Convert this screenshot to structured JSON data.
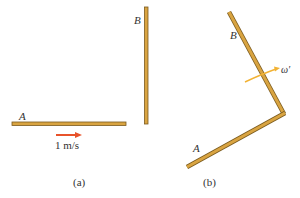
{
  "figure_a": {
    "rod_a_label": "A",
    "rod_b_label": "B",
    "velocity_label": "1 m/s",
    "caption": "(a)"
  },
  "figure_b": {
    "rod_a_label": "A",
    "rod_b_label": "B",
    "angular_velocity_label": "ω′",
    "caption": "(b)"
  },
  "colors": {
    "rod_fill": "#D9A441",
    "rod_edge": "#7A5A1E",
    "velocity_arrow": "#E8532B",
    "rotation_arrow": "#F2B233",
    "text": "#333333"
  }
}
